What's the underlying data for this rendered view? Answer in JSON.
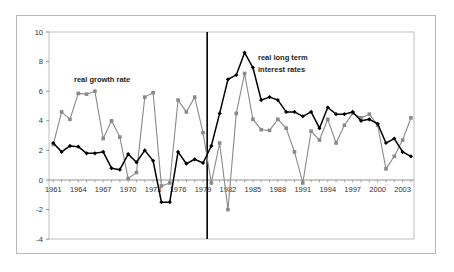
{
  "chart_data": {
    "type": "line",
    "title": "",
    "xlabel": "",
    "ylabel": "",
    "ylim": [
      -4,
      10
    ],
    "yticks": [
      -4,
      -2,
      0,
      2,
      4,
      6,
      8,
      10
    ],
    "xlim": [
      1961,
      2004
    ],
    "xtick_labels": [
      "1961",
      "1964",
      "1967",
      "1970",
      "1973",
      "1976",
      "1979",
      "1982",
      "1985",
      "1988",
      "1991",
      "1994",
      "1997",
      "2000",
      "2003"
    ],
    "grid": false,
    "legend": "none (inline annotations)",
    "vertical_marker": {
      "between": [
        1979,
        1980
      ],
      "color": "#000000"
    },
    "annotations": [
      {
        "text": "real growth rate",
        "near_series": "real growth rate"
      },
      {
        "text": "real long term",
        "near_series": "real long term interest rates"
      },
      {
        "text": "interest rates",
        "near_series": "real long term interest rates"
      }
    ],
    "x": [
      1961,
      1962,
      1963,
      1964,
      1965,
      1966,
      1967,
      1968,
      1969,
      1970,
      1971,
      1972,
      1973,
      1974,
      1975,
      1976,
      1977,
      1978,
      1979,
      1980,
      1981,
      1982,
      1983,
      1984,
      1985,
      1986,
      1987,
      1988,
      1989,
      1990,
      1991,
      1992,
      1993,
      1994,
      1995,
      1996,
      1997,
      1998,
      1999,
      2000,
      2001,
      2002,
      2003,
      2004
    ],
    "series": [
      {
        "name": "real growth rate",
        "color": "#8a8a8a",
        "marker": "square",
        "values": [
          2.4,
          4.6,
          4.1,
          5.85,
          5.8,
          6.0,
          2.8,
          4.0,
          2.9,
          0.1,
          0.5,
          5.6,
          5.9,
          -0.4,
          -0.2,
          5.4,
          4.6,
          5.6,
          3.2,
          -0.2,
          2.5,
          -2.0,
          4.5,
          7.2,
          4.1,
          3.4,
          3.35,
          4.1,
          3.5,
          1.9,
          -0.2,
          3.3,
          2.7,
          4.1,
          2.5,
          3.7,
          4.5,
          4.2,
          4.45,
          3.7,
          0.75,
          1.6,
          2.7,
          4.2
        ]
      },
      {
        "name": "real long term interest rates",
        "color": "#000000",
        "marker": "diamond",
        "values": [
          2.5,
          1.9,
          2.3,
          2.25,
          1.8,
          1.8,
          1.9,
          0.8,
          0.7,
          1.75,
          1.2,
          2.0,
          1.3,
          -1.5,
          -1.5,
          1.9,
          1.1,
          1.4,
          1.15,
          2.3,
          4.5,
          6.8,
          7.1,
          8.6,
          7.6,
          5.4,
          5.6,
          5.4,
          4.6,
          4.6,
          4.3,
          4.6,
          3.5,
          4.9,
          4.45,
          4.45,
          4.6,
          4.0,
          4.1,
          3.8,
          2.5,
          2.8,
          1.9,
          1.6
        ]
      }
    ]
  },
  "labels": {
    "growth": "real growth rate",
    "interest_line1": "real long term",
    "interest_line2": "interest rates"
  }
}
